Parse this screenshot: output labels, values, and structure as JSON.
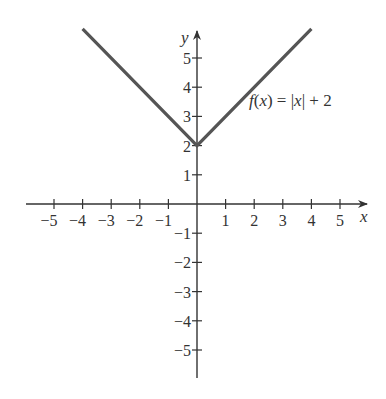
{
  "chart_data": {
    "type": "line",
    "title": "",
    "xlabel": "x",
    "ylabel": "y",
    "xlim": [
      -5.8,
      5.9
    ],
    "ylim": [
      -6.0,
      6.0
    ],
    "grid": false,
    "x_ticks": [
      -5,
      -4,
      -3,
      -2,
      -1,
      1,
      2,
      3,
      4,
      5
    ],
    "y_ticks": [
      -5,
      -4,
      -3,
      -2,
      -1,
      1,
      2,
      3,
      4,
      5
    ],
    "x_tick_labels": [
      "−5",
      "−4",
      "−3",
      "−2",
      "−1",
      "1",
      "2",
      "3",
      "4",
      "5"
    ],
    "y_tick_labels": [
      "−5",
      "−4",
      "−3",
      "−2",
      "−1",
      "1",
      "2",
      "3",
      "4",
      "5"
    ],
    "series": [
      {
        "name": "f(x) = |x| + 2",
        "color": "#555555",
        "x": [
          -4,
          0,
          4
        ],
        "y": [
          6,
          2,
          6
        ]
      }
    ],
    "annotations": [
      {
        "text": "f(x) = |x| + 2",
        "x": 1.8,
        "y": 3.6
      }
    ]
  },
  "labels": {
    "x_axis": "x",
    "y_axis": "y",
    "function": "f(x) = |x| + 2"
  },
  "colors": {
    "axis": "#333333",
    "curve": "#555555",
    "text": "#333333"
  }
}
